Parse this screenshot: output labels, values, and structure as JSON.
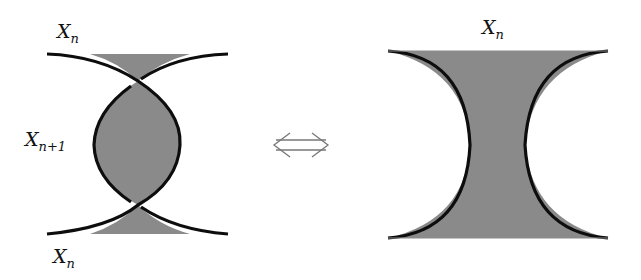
{
  "colors": {
    "fill": "#8a8a8a",
    "stroke": "#0d0d0d",
    "arrow": "#777777",
    "background": "#ffffff"
  },
  "left_figure": {
    "label_top": {
      "base": "X",
      "sub": "n"
    },
    "label_middle": {
      "base": "X",
      "sub": "n+1"
    },
    "label_bottom": {
      "base": "X",
      "sub": "n"
    }
  },
  "equivalence_symbol": {
    "glyph": "⟺",
    "name": "double-arrow-left-right"
  },
  "right_figure": {
    "label_top": {
      "base": "X",
      "sub": "n"
    }
  }
}
